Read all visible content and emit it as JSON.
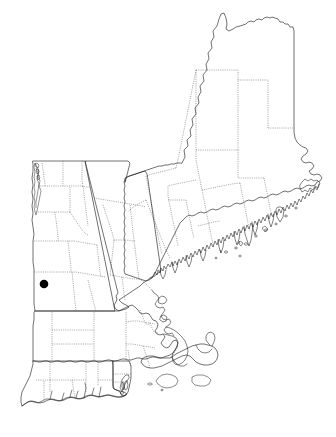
{
  "map": {
    "title": "New England Distribution Map",
    "region_label": "New England",
    "projection_note": "",
    "width": 336,
    "height": 437,
    "background_color": "#ffffff",
    "outline_color": "#1a1a1a",
    "county_line_color": "#555555",
    "marker_color": "#000000"
  },
  "legend": {
    "marker_shape": "filled-circle",
    "marker_meaning": "occurrence record"
  },
  "states": [
    {
      "id": "ME",
      "name": "Maine",
      "label": ""
    },
    {
      "id": "NH",
      "name": "New Hampshire",
      "label": ""
    },
    {
      "id": "VT",
      "name": "Vermont",
      "label": ""
    },
    {
      "id": "MA",
      "name": "Massachusetts",
      "label": ""
    },
    {
      "id": "CT",
      "name": "Connecticut",
      "label": ""
    },
    {
      "id": "RI",
      "name": "Rhode Island",
      "label": ""
    }
  ],
  "occurrences": [
    {
      "id": "pt-1",
      "state": "VT",
      "x": 44,
      "y": 284,
      "radius": 4.3,
      "color": "#000000",
      "label": ""
    }
  ],
  "chart_data": {
    "type": "scatter",
    "title": "New England Distribution Map",
    "xlabel": "",
    "ylabel": "",
    "xlim": [
      0,
      336
    ],
    "ylim": [
      437,
      0
    ],
    "grid": false,
    "legend_position": "none",
    "series": [
      {
        "name": "occurrence records",
        "marker": "filled-circle",
        "color": "#000000",
        "points": [
          {
            "x": 44,
            "y": 284,
            "state": "VT"
          }
        ]
      }
    ],
    "annotations": []
  }
}
